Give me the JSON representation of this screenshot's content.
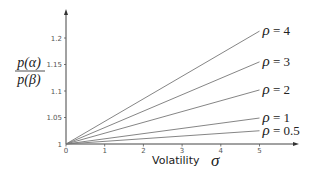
{
  "chart_data": {
    "type": "line",
    "title": "",
    "xlabel": "Volatility σ",
    "ylabel": "p(α) / p(β)",
    "ylabel_num": "p(α)",
    "ylabel_den": "p(β)",
    "xlabel_text": "Volatility",
    "xlabel_symbol": "σ",
    "xlim": [
      0,
      5.9
    ],
    "ylim": [
      1,
      1.25
    ],
    "x_ticks": [
      "0",
      "1",
      "2",
      "3",
      "4",
      "5"
    ],
    "y_ticks": [
      "1",
      "1.05",
      "1.1",
      "1.15",
      "1.2"
    ],
    "grid": false,
    "legend": "inline labels at line ends",
    "x": [
      0,
      5
    ],
    "series": [
      {
        "name": "ρ = 4",
        "values": [
          1,
          1.213
        ]
      },
      {
        "name": "ρ = 3",
        "values": [
          1,
          1.155
        ]
      },
      {
        "name": "ρ = 2",
        "values": [
          1,
          1.102
        ]
      },
      {
        "name": "ρ = 1",
        "values": [
          1,
          1.049
        ]
      },
      {
        "name": "ρ = 0.5",
        "values": [
          1,
          1.025
        ]
      }
    ],
    "colors": {
      "line": "#777777",
      "axis": "#555555"
    }
  }
}
